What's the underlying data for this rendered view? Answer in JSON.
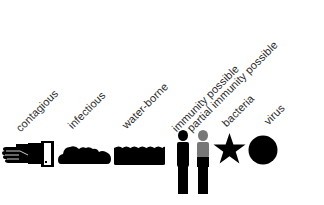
{
  "legend": {
    "items": [
      {
        "id": "contagious",
        "label": "contagious",
        "icon": "hand-door-icon"
      },
      {
        "id": "infectious",
        "label": "infectious",
        "icon": "cloud-icon"
      },
      {
        "id": "water-borne",
        "label": "water-borne",
        "icon": "water-icon"
      },
      {
        "id": "immunity-possible",
        "label": "immunity possible",
        "icon": "person-black-icon"
      },
      {
        "id": "partial-immunity-possible",
        "label": "partial immunity possible",
        "icon": "person-half-gray-icon"
      },
      {
        "id": "bacteria",
        "label": "bacteria",
        "icon": "star-icon"
      },
      {
        "id": "virus",
        "label": "virus",
        "icon": "circle-icon"
      }
    ]
  },
  "colors": {
    "icon": "#000000",
    "partial": "#777777",
    "label": "#2a2a2a",
    "background": "#ffffff"
  }
}
